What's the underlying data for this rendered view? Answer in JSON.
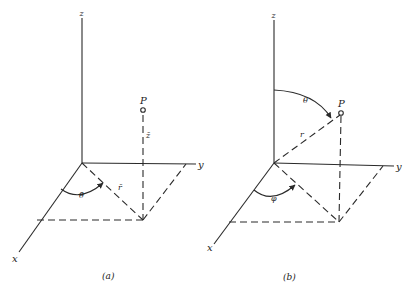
{
  "figure": {
    "panels": [
      {
        "id": "a",
        "caption": "(a)",
        "coordinate_system": "cylindrical",
        "axis_labels": {
          "x": "x",
          "y": "y",
          "z": "z"
        },
        "point_label": "P",
        "angle_label": "θ̄",
        "radius_label": "r̄",
        "height_label": "z̄"
      },
      {
        "id": "b",
        "caption": "(b)",
        "coordinate_system": "spherical",
        "axis_labels": {
          "x": "x",
          "y": "y",
          "z": "z"
        },
        "point_label": "P",
        "polar_angle_label": "θ",
        "radius_label": "r",
        "azimuth_label": "φ"
      }
    ]
  }
}
